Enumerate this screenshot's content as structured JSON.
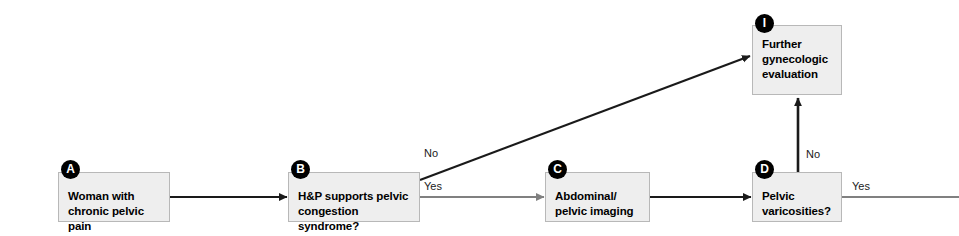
{
  "diagram": {
    "canvas": {
      "width": 959,
      "height": 236,
      "background": "#ffffff"
    },
    "colors": {
      "box_fill": "#eeeeee",
      "box_border": "#b8b8b8",
      "badge_fill": "#000000",
      "badge_text": "#ffffff",
      "arrow_black": "#1a1a1a",
      "arrow_gray": "#808080",
      "text": "#000000"
    }
  },
  "nodes": {
    "a": {
      "badge": "A",
      "text": "Woman with\nchronic pelvic pain"
    },
    "b": {
      "badge": "B",
      "text": "H&P supports pelvic\ncongestion syndrome?"
    },
    "c": {
      "badge": "C",
      "text": "Abdominal/\npelvic imaging"
    },
    "d": {
      "badge": "D",
      "text": "Pelvic\nvaricosities?"
    },
    "i": {
      "badge": "I",
      "text": "Further\ngynecologic\nevaluation"
    }
  },
  "edge_labels": {
    "b_no": "No",
    "b_yes": "Yes",
    "d_no": "No",
    "d_yes": "Yes"
  }
}
